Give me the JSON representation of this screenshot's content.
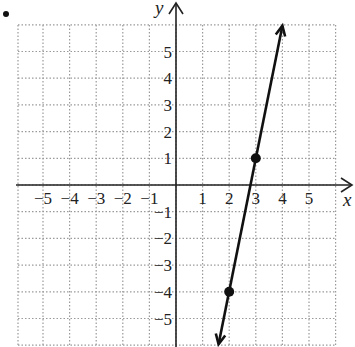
{
  "chart_data": {
    "type": "line",
    "title": "",
    "xlabel": "x",
    "ylabel": "y",
    "xlim": [
      -6,
      6
    ],
    "ylim": [
      -6,
      6
    ],
    "grid": true,
    "grid_style": "dotted",
    "x_ticks": [
      -5,
      -4,
      -3,
      -2,
      -1,
      1,
      2,
      3,
      4,
      5
    ],
    "y_ticks": [
      5,
      4,
      3,
      2,
      1,
      -1,
      -2,
      -3,
      -4,
      -5
    ],
    "x_tick_labels": [
      "−5",
      "−4",
      "−3",
      "−2",
      "−1",
      "1",
      "2",
      "3",
      "4",
      "5"
    ],
    "y_tick_labels": [
      "5",
      "4",
      "3",
      "2",
      "1",
      "−1",
      "−2",
      "−3",
      "−4",
      "−5"
    ],
    "series": [
      {
        "name": "line",
        "equation": "y = 5x - 14",
        "slope": 5,
        "intercept": -14,
        "marked_points": [
          {
            "x": 3,
            "y": 1
          },
          {
            "x": 2,
            "y": -4
          }
        ],
        "arrows_both_ends": true,
        "color": "#111111"
      }
    ]
  },
  "colors": {
    "axis": "#222222",
    "grid": "#9a9a9a",
    "line": "#111111"
  }
}
